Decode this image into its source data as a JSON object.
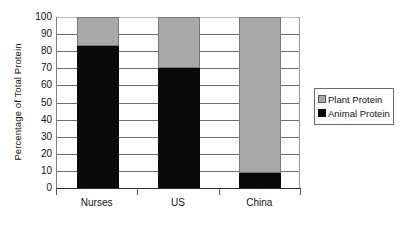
{
  "chart_data": {
    "type": "bar",
    "subtype": "stacked-column",
    "title": "",
    "xlabel": "",
    "ylabel": "Percentage of Total Protein",
    "categories": [
      "Nurses",
      "US",
      "China"
    ],
    "series": [
      {
        "name": "Animal Protein",
        "values": [
          83,
          70,
          9
        ],
        "color": "#0a0a0a"
      },
      {
        "name": "Plant Protein",
        "values": [
          17,
          30,
          91
        ],
        "color": "#a9a9a9"
      }
    ],
    "ylim": [
      0,
      100
    ],
    "y_ticks": [
      0,
      10,
      20,
      30,
      40,
      50,
      60,
      70,
      80,
      90,
      100
    ],
    "y_tick_labels": [
      "0",
      "10",
      "20",
      "30",
      "40",
      "50",
      "60",
      "70",
      "80",
      "90",
      "100"
    ],
    "grid": true,
    "grid_axis": "y",
    "legend_position": "right",
    "legend_entries": [
      "Plant Protein",
      "Animal Protein"
    ],
    "stack_order_bottom_to_top": [
      "Animal Protein",
      "Plant Protein"
    ],
    "value_units": "percent",
    "stack_total": 100
  },
  "legend": {
    "plant_label": "Plant Protein",
    "animal_label": "Animal Protein"
  },
  "axes": {
    "y_title": "Percentage of Total Protein"
  }
}
